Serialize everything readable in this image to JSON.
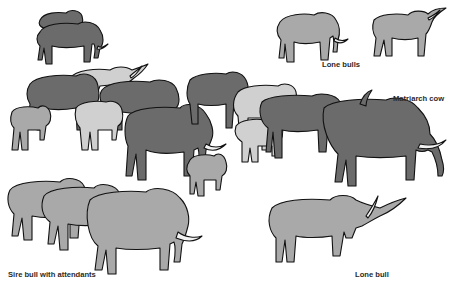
{
  "figure": {
    "colors": {
      "background": "#ffffff",
      "dark_elephant": "#6b6b6b",
      "medium_elephant": "#a9a9a9",
      "light_elephant": "#d0d0d0",
      "outline": "#111111",
      "label_text": "#2a2a2a"
    },
    "labels": {
      "lone_bulls": "Lone bulls",
      "matriarch_cow": "Matriarch cow",
      "sire_bull": "Sire bull with attendants",
      "lone_bull": "Lone bull"
    },
    "groups": [
      {
        "name": "pair-top-left",
        "count": 2,
        "shade": "dark"
      },
      {
        "name": "lone-bulls-top-right",
        "count": 2,
        "shade": "medium"
      },
      {
        "name": "family-herd-center",
        "count": 12,
        "shade": "mixed"
      },
      {
        "name": "sire-bull-group-bottom-left",
        "count": 3,
        "shade": "medium"
      },
      {
        "name": "lone-bull-bottom-right",
        "count": 1,
        "shade": "medium"
      }
    ]
  }
}
